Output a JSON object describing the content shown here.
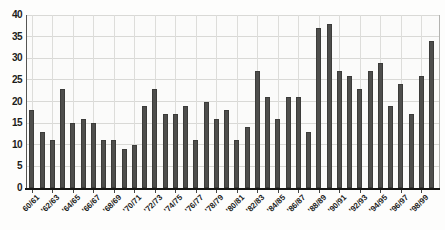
{
  "chart_data": {
    "type": "bar",
    "title": "",
    "xlabel": "",
    "ylabel": "",
    "ylim": [
      0,
      40
    ],
    "y_tick_step": 5,
    "y_tick_labels": [
      "0",
      "5",
      "10",
      "15",
      "20",
      "25",
      "30",
      "35",
      "40"
    ],
    "grid": true,
    "legend": false,
    "bar_color": "#4e4e4c",
    "grid_color": "#d9d9d6",
    "values": [
      18,
      13,
      11,
      23,
      15,
      16,
      15,
      11,
      11,
      9,
      10,
      19,
      23,
      17,
      17,
      19,
      11,
      20,
      16,
      18,
      11,
      14,
      27,
      21,
      16,
      21,
      21,
      13,
      37,
      38,
      27,
      26,
      23,
      27,
      29,
      19,
      24,
      17,
      26,
      34
    ],
    "x_tick_labels": [
      "60/61",
      "'62/63",
      "'64/65",
      "'66/67",
      "'68/69",
      "'70/71",
      "'72/73",
      "'74/75",
      "'76/77",
      "'78/79",
      "'80/81",
      "'82/83",
      "'84/85",
      "'86/87",
      "'88/89",
      "'90/91",
      "'92/93",
      "'94/95",
      "'96/97",
      "'98/99"
    ],
    "x_tick_bar_indices": [
      0,
      2,
      4,
      6,
      8,
      10,
      12,
      14,
      16,
      18,
      20,
      22,
      24,
      26,
      28,
      30,
      32,
      34,
      36,
      38
    ],
    "x_tick_label_rotation_deg": 45
  }
}
